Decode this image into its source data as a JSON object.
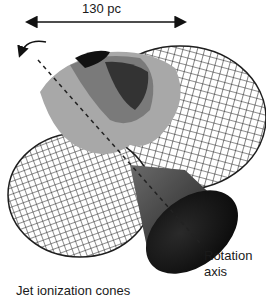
{
  "scale_bar": {
    "label": "130 pc"
  },
  "labels": {
    "rotation_line1": "Rotation",
    "rotation_line2": "axis",
    "jet_cones": "Jet ionization cones"
  },
  "colors": {
    "wireframe": "#1e1e1e",
    "cone_dark": "#0d0d0d",
    "cone_mid": "#5a5a5a",
    "cloud_light": "#a8a8a8",
    "cloud_mid": "#7a7a7a",
    "cloud_dark": "#333333"
  }
}
